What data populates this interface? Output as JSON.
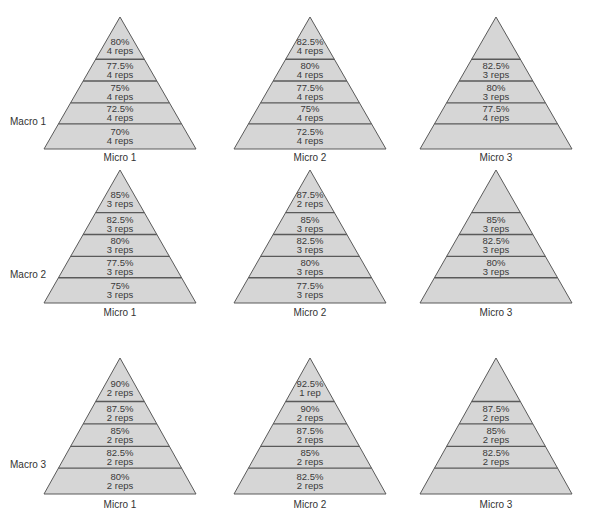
{
  "diagram": {
    "type": "pyramid-grid",
    "style": {
      "fill": "#d6d6d6",
      "stroke": "#5a5a5a",
      "text": "#3a3a3a"
    },
    "rows": [
      {
        "label": "Macro 1",
        "cells": [
          {
            "label": "Micro 1",
            "bands": [
              [
                "",
                ""
              ],
              [
                "80%",
                "4 reps"
              ],
              [
                "77.5%",
                "4 reps"
              ],
              [
                "75%",
                "4 reps"
              ],
              [
                "72.5%",
                "4 reps"
              ],
              [
                "70%",
                "4 reps"
              ]
            ]
          },
          {
            "label": "Micro 2",
            "bands": [
              [
                "",
                ""
              ],
              [
                "82.5%",
                "4 reps"
              ],
              [
                "80%",
                "4 reps"
              ],
              [
                "77.5%",
                "4 reps"
              ],
              [
                "75%",
                "4 reps"
              ],
              [
                "72.5%",
                "4 reps"
              ]
            ]
          },
          {
            "label": "Micro 3",
            "bands": [
              [
                "",
                ""
              ],
              [
                "",
                ""
              ],
              [
                "82.5%",
                "3 reps"
              ],
              [
                "80%",
                "3 reps"
              ],
              [
                "77.5%",
                "4 reps"
              ],
              [
                "",
                ""
              ]
            ]
          }
        ]
      },
      {
        "label": "Macro 2",
        "cells": [
          {
            "label": "Micro 1",
            "bands": [
              [
                "",
                ""
              ],
              [
                "85%",
                "3 reps"
              ],
              [
                "82.5%",
                "3 reps"
              ],
              [
                "80%",
                "3 reps"
              ],
              [
                "77.5%",
                "3 reps"
              ],
              [
                "75%",
                "3 reps"
              ]
            ]
          },
          {
            "label": "Micro 2",
            "bands": [
              [
                "",
                ""
              ],
              [
                "87.5%",
                "2 reps"
              ],
              [
                "85%",
                "3 reps"
              ],
              [
                "82.5%",
                "3 reps"
              ],
              [
                "80%",
                "3 reps"
              ],
              [
                "77.5%",
                "3 reps"
              ]
            ]
          },
          {
            "label": "Micro 3",
            "bands": [
              [
                "",
                ""
              ],
              [
                "",
                ""
              ],
              [
                "85%",
                "3 reps"
              ],
              [
                "82.5%",
                "3 reps"
              ],
              [
                "80%",
                "3 reps"
              ],
              [
                "",
                ""
              ]
            ]
          }
        ]
      },
      {
        "label": "Macro 3",
        "cells": [
          {
            "label": "Micro 1",
            "bands": [
              [
                "",
                ""
              ],
              [
                "90%",
                "2 reps"
              ],
              [
                "87.5%",
                "2 reps"
              ],
              [
                "85%",
                "2 reps"
              ],
              [
                "82.5%",
                "2 reps"
              ],
              [
                "80%",
                "2 reps"
              ]
            ]
          },
          {
            "label": "Micro 2",
            "bands": [
              [
                "",
                ""
              ],
              [
                "92.5%",
                "1 rep"
              ],
              [
                "90%",
                "2 reps"
              ],
              [
                "87.5%",
                "2 reps"
              ],
              [
                "85%",
                "2 reps"
              ],
              [
                "82.5%",
                "2 reps"
              ]
            ]
          },
          {
            "label": "Micro 3",
            "bands": [
              [
                "",
                ""
              ],
              [
                "",
                ""
              ],
              [
                "87.5%",
                "2 reps"
              ],
              [
                "85%",
                "2 reps"
              ],
              [
                "82.5%",
                "2 reps"
              ],
              [
                "",
                ""
              ]
            ]
          }
        ]
      }
    ]
  }
}
